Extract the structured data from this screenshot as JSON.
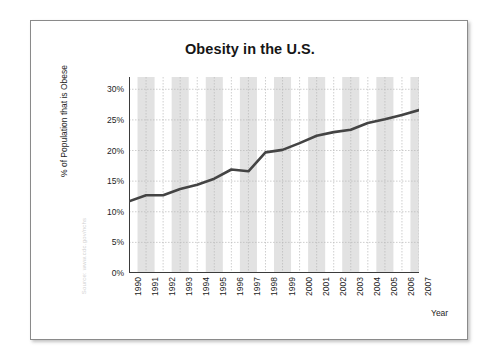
{
  "figure": {
    "source_note": "Source: www.cdc.gov/nchs",
    "x_axis_title": "Year"
  },
  "chart_data": {
    "type": "line",
    "title": "Obesity in the U.S.",
    "xlabel": "Year",
    "ylabel": "% of Population that is Obese",
    "categories": [
      "1990",
      "1991",
      "1992",
      "1993",
      "1994",
      "1995",
      "1996",
      "1997",
      "1998",
      "1999",
      "2000",
      "2001",
      "2002",
      "2003",
      "2004",
      "2005",
      "2006",
      "2007"
    ],
    "values": [
      11.7,
      12.7,
      12.7,
      13.7,
      14.4,
      15.4,
      16.9,
      16.6,
      19.7,
      20.1,
      21.2,
      22.4,
      23.0,
      23.4,
      24.5,
      25.1,
      25.8,
      26.6
    ],
    "ylim": [
      0,
      32
    ],
    "y_ticks": [
      0,
      5,
      10,
      15,
      20,
      25,
      30
    ],
    "y_tick_labels": [
      "0%",
      "5%",
      "10%",
      "15%",
      "20%",
      "25%",
      "30%"
    ],
    "grid": true,
    "legend": "none",
    "series_color": "#444444",
    "band_color": "#e2e2e2",
    "background": "#ffffff"
  }
}
